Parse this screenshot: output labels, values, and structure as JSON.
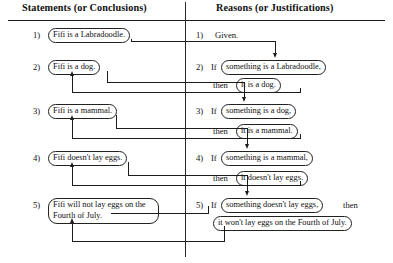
{
  "table": {
    "headers": {
      "statements": "Statements (or Conclusions)",
      "reasons": "Reasons (or Justifications)"
    },
    "numbers": [
      "1)",
      "2)",
      "3)",
      "4)",
      "5)"
    ],
    "keywords": {
      "if": "If",
      "then": "then"
    },
    "statements": [
      {
        "number": "1)",
        "text": "Fifi is a Labradoodle."
      },
      {
        "number": "2)",
        "text": "Fifi is a dog."
      },
      {
        "number": "3)",
        "text": "Fifi is a mammal."
      },
      {
        "number": "4)",
        "text": "Fifi doesn't lay eggs."
      },
      {
        "number": "5)",
        "text": "Fifi will not lay eggs on the Fourth of July."
      }
    ],
    "reasons": [
      {
        "number": "1)",
        "plain": "Given.",
        "antecedent": "",
        "consequent": ""
      },
      {
        "number": "2)",
        "plain": "",
        "antecedent": "something is a Labradoodle,",
        "consequent": "it is a dog."
      },
      {
        "number": "3)",
        "plain": "",
        "antecedent": "something is a dog,",
        "consequent": "it is a mammal."
      },
      {
        "number": "4)",
        "plain": "",
        "antecedent": "something is a mammal,",
        "consequent": "it doesn't lay eggs."
      },
      {
        "number": "5)",
        "plain": "",
        "antecedent": "something doesn't lay eggs,",
        "consequent": "it won't lay eggs on the Fourth of July."
      }
    ]
  },
  "colors": {
    "rule": "#1a1a1a",
    "box_border": "#222222",
    "connector": "#1c1c1c",
    "background": "#ffffff",
    "text": "#101010"
  }
}
